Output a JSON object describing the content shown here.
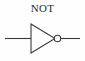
{
  "diagram": {
    "title": "NOT",
    "symbol_name": "not-gate",
    "background_color": "#fefefe",
    "stroke_color": "#3a3a3a",
    "label_color": "#2b2b2b",
    "elements": {
      "input_wire_label": "input-wire",
      "triangle_label": "inverter-triangle",
      "bubble_label": "inversion-bubble",
      "output_wire_label": "output-wire"
    },
    "geometry": {
      "input_wire": {
        "x1": 5,
        "y1": 38.5,
        "x2": 31,
        "y2": 38.5
      },
      "triangle": {
        "points": "31,24 31,53 55,38.5"
      },
      "bubble": {
        "cx": 57.5,
        "cy": 38.5,
        "r": 3.2
      },
      "output_wire": {
        "x1": 60.7,
        "y1": 38.5,
        "x2": 80,
        "y2": 38.5
      }
    }
  }
}
